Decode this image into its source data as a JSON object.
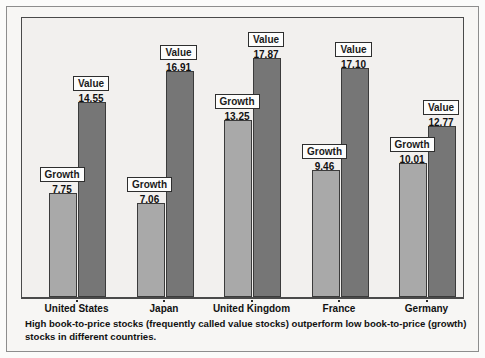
{
  "chart_data": {
    "type": "bar",
    "title": "",
    "subtitle": "",
    "xlabel": "",
    "ylabel": "",
    "ylim": [
      0,
      21
    ],
    "grid": false,
    "legend_position": "none",
    "categories": [
      "United States",
      "Japan",
      "United Kingdom",
      "France",
      "Germany"
    ],
    "series": [
      {
        "name": "Growth",
        "color": "#a9a9a9",
        "values": [
          7.75,
          7.06,
          13.25,
          9.46,
          10.01
        ]
      },
      {
        "name": "Value",
        "color": "#767676",
        "values": [
          14.55,
          16.91,
          17.87,
          17.1,
          12.77
        ]
      }
    ],
    "point_labels": [
      {
        "series": "Growth",
        "category": "United States",
        "tag": "Growth",
        "value": "7.75"
      },
      {
        "series": "Value",
        "category": "United States",
        "tag": "Value",
        "value": "14.55"
      },
      {
        "series": "Growth",
        "category": "Japan",
        "tag": "Growth",
        "value": "7.06"
      },
      {
        "series": "Value",
        "category": "Japan",
        "tag": "Value",
        "value": "16.91"
      },
      {
        "series": "Growth",
        "category": "United Kingdom",
        "tag": "Growth",
        "value": "13.25"
      },
      {
        "series": "Value",
        "category": "United Kingdom",
        "tag": "Value",
        "value": "17.87"
      },
      {
        "series": "Growth",
        "category": "France",
        "tag": "Growth",
        "value": "9.46"
      },
      {
        "series": "Value",
        "category": "France",
        "tag": "Value",
        "value": "17.10"
      },
      {
        "series": "Growth",
        "category": "Germany",
        "tag": "Growth",
        "value": "10.01"
      },
      {
        "series": "Value",
        "category": "Germany",
        "tag": "Value",
        "value": "12.77"
      }
    ]
  },
  "caption": {
    "text": "High book-to-price stocks (frequently called value stocks) outperform low book-to-price (growth) stocks in different countries."
  },
  "colors": {
    "growth_bar": "#a9a9a9",
    "value_bar": "#767676",
    "bar_outline": "#3b3b3b",
    "plot_background": "#f2f0ee",
    "figure_background": "#f7f6f4",
    "frame": "#4a4a4a",
    "text": "#111111"
  }
}
